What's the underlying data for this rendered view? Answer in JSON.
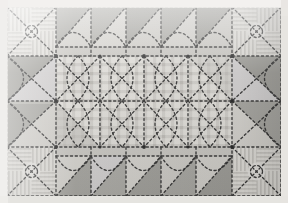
{
  "image": {
    "title": "Patchwork quilt photograph",
    "width": 288,
    "height": 203,
    "palette": {
      "background": "#e9e9e7",
      "backing_light": "#f2f1ee",
      "fabric_light": "#d9d8d4",
      "fabric_midlight": "#c8c7c3",
      "fabric_mid": "#b3b2ad",
      "fabric_dark": "#9b9a95",
      "fabric_darker": "#8a8984",
      "stitch": "#2b2b2b",
      "gingham_base": "#dedcd7",
      "gingham_line": "#c6c4bf",
      "stripe_base": "#dcdad5",
      "stripe_line": "#c2c0bb"
    }
  },
  "quilt": {
    "layout": "bordered medallion, 4 corner blocks + sawtooth borders + gingham center field",
    "corner_blocks": [
      {
        "name": "corner-block-top-left",
        "fabric": "striped",
        "motif": "x-cross-quilting"
      },
      {
        "name": "corner-block-top-right",
        "fabric": "striped",
        "motif": "x-cross-quilting"
      },
      {
        "name": "corner-block-bottom-left",
        "fabric": "striped",
        "motif": "x-cross-quilting"
      },
      {
        "name": "corner-block-bottom-right",
        "fabric": "striped",
        "motif": "x-cross-quilting"
      }
    ],
    "borders": [
      {
        "name": "border-top",
        "pattern": "sawtooth-triangles",
        "units": 5
      },
      {
        "name": "border-bottom",
        "pattern": "sawtooth-triangles",
        "units": 5
      },
      {
        "name": "border-left",
        "pattern": "hourglass-triangles",
        "units": 2
      },
      {
        "name": "border-right",
        "pattern": "hourglass-triangles",
        "units": 2
      }
    ],
    "center_field": {
      "name": "center-field",
      "fabric": "gingham-check",
      "quilting": "diagonal-crosshatch",
      "columns": 4,
      "rows": 2
    },
    "stitching": {
      "name": "quilting-stitch-lines",
      "style": "dashed",
      "color": "#2b2b2b"
    }
  }
}
